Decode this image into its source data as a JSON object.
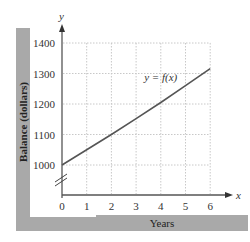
{
  "chart_data": {
    "type": "line",
    "title": "",
    "xlabel": "Years",
    "ylabel": "Balance (dollars)",
    "x_axis_name": "x",
    "y_axis_name": "y",
    "x": [
      0,
      1,
      2,
      3,
      4,
      5,
      6
    ],
    "series": [
      {
        "name": "y = f(x)",
        "values": [
          1000,
          1050,
          1100,
          1152,
          1205,
          1260,
          1316
        ]
      }
    ],
    "x_ticks": [
      "0",
      "1",
      "2",
      "3",
      "4",
      "5",
      "6"
    ],
    "y_ticks": [
      "1000",
      "1100",
      "1200",
      "1300",
      "1400"
    ],
    "xlim": [
      0,
      6
    ],
    "ylim": [
      1000,
      1400
    ],
    "y_axis_break": true,
    "grid": true,
    "annotations": [
      {
        "text": "y = f(x)",
        "x": 4.3,
        "y": 1290
      }
    ],
    "legend": "none"
  },
  "colors": {
    "band": "#a9a9a9",
    "axis": "#555555",
    "grid": "#c8c8c8",
    "curve": "#555555"
  }
}
